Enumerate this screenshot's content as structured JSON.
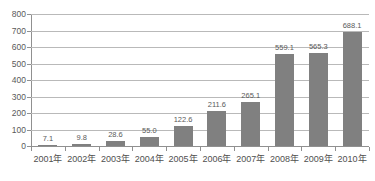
{
  "chart_data": {
    "type": "bar",
    "title": "",
    "subtitle": "",
    "xlabel": "",
    "ylabel": "",
    "categories": [
      "2001年",
      "2002年",
      "2003年",
      "2004年",
      "2005年",
      "2006年",
      "2007年",
      "2008年",
      "2009年",
      "2010年"
    ],
    "values": [
      7.1,
      9.8,
      28.6,
      55.0,
      122.6,
      211.6,
      265.1,
      559.1,
      565.3,
      688.1
    ],
    "value_labels": [
      "7.1",
      "9.8",
      "28.6",
      "55.0",
      "122.6",
      "211.6",
      "265.1",
      "559.1",
      "565.3",
      "688.1"
    ],
    "ylim": [
      0,
      800
    ],
    "yticks": [
      0,
      100,
      200,
      300,
      400,
      500,
      600,
      700,
      800
    ],
    "ytick_labels": [
      "0",
      "100",
      "200",
      "300",
      "400",
      "500",
      "600",
      "700",
      "800"
    ],
    "grid": true,
    "legend": null,
    "legend_position": "none",
    "series_color": "#808080",
    "grid_color": "#b9b9b9",
    "axis_color": "#909090",
    "text_color": "#555555",
    "background": "#ffffff"
  }
}
